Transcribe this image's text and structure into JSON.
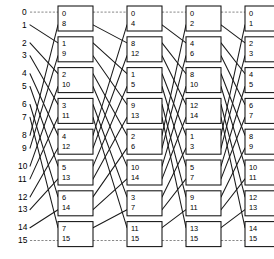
{
  "figure": {
    "type": "butterfly-network-diagram",
    "name": "16-input omega / butterfly interconnection network",
    "inputs_count": 16,
    "stages_count": 4,
    "boxes_per_stage": 8,
    "colors": {
      "line": "#1a1a1a",
      "box_border": "#111111",
      "box_fill": "#ffffff",
      "background": "#ffffff",
      "text": "#000000"
    }
  },
  "input_labels": [
    "0",
    "1",
    "2",
    "3",
    "4",
    "5",
    "6",
    "7",
    "8",
    "9",
    "10",
    "11",
    "12",
    "13",
    "14",
    "15"
  ],
  "stages": [
    {
      "index": 1,
      "name": "stage-1",
      "boxes": [
        {
          "top": "0",
          "bottom": "8"
        },
        {
          "top": "1",
          "bottom": "9"
        },
        {
          "top": "2",
          "bottom": "10"
        },
        {
          "top": "3",
          "bottom": "11"
        },
        {
          "top": "4",
          "bottom": "12"
        },
        {
          "top": "5",
          "bottom": "13"
        },
        {
          "top": "6",
          "bottom": "14"
        },
        {
          "top": "7",
          "bottom": "15"
        }
      ]
    },
    {
      "index": 2,
      "name": "stage-2",
      "boxes": [
        {
          "top": "0",
          "bottom": "4"
        },
        {
          "top": "8",
          "bottom": "12"
        },
        {
          "top": "1",
          "bottom": "5"
        },
        {
          "top": "9",
          "bottom": "13"
        },
        {
          "top": "2",
          "bottom": "6"
        },
        {
          "top": "10",
          "bottom": "14"
        },
        {
          "top": "3",
          "bottom": "7"
        },
        {
          "top": "11",
          "bottom": "15"
        }
      ]
    },
    {
      "index": 3,
      "name": "stage-3",
      "boxes": [
        {
          "top": "0",
          "bottom": "2"
        },
        {
          "top": "4",
          "bottom": "6"
        },
        {
          "top": "8",
          "bottom": "10"
        },
        {
          "top": "12",
          "bottom": "14"
        },
        {
          "top": "1",
          "bottom": "3"
        },
        {
          "top": "5",
          "bottom": "7"
        },
        {
          "top": "9",
          "bottom": "11"
        },
        {
          "top": "13",
          "bottom": "15"
        }
      ]
    },
    {
      "index": 4,
      "name": "stage-4",
      "boxes": [
        {
          "top": "0",
          "bottom": "1"
        },
        {
          "top": "2",
          "bottom": "3"
        },
        {
          "top": "4",
          "bottom": "5"
        },
        {
          "top": "6",
          "bottom": "7"
        },
        {
          "top": "8",
          "bottom": "9"
        },
        {
          "top": "10",
          "bottom": "11"
        },
        {
          "top": "12",
          "bottom": "13"
        },
        {
          "top": "14",
          "bottom": "15"
        }
      ]
    }
  ],
  "geometry": {
    "row_top_y": 18.5,
    "row_step": 30.8,
    "pair_offset": 10.4,
    "stage_x": [
      58,
      127,
      186,
      245
    ],
    "box_w": 35,
    "box_h": 25,
    "label_x_single": 22,
    "label_x_double": 18
  }
}
